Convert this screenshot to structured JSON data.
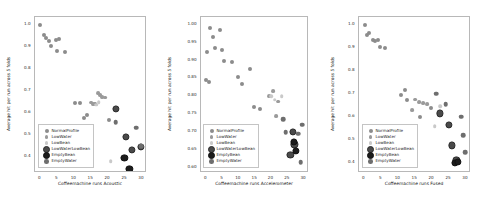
{
  "figure": {
    "width": 486,
    "height": 208,
    "background": "#ffffff",
    "panel_count": 3
  },
  "series_styles": [
    {
      "name": "NormalProfile",
      "color": "#8c8c8c",
      "size": 2.0,
      "edge": "none"
    },
    {
      "name": "LowWater",
      "color": "#9a9a9a",
      "size": 1.9,
      "edge": "none"
    },
    {
      "name": "LowBean",
      "color": "#c9c9c9",
      "size": 1.8,
      "edge": "none"
    },
    {
      "name": "LowWaterLowBean",
      "color": "#4a4a4a",
      "size": 2.6,
      "edge": "#2a2a2a"
    },
    {
      "name": "EmptyBean",
      "color": "#1c1c1c",
      "size": 2.6,
      "edge": "#111111"
    },
    {
      "name": "EmptyWater",
      "color": "#6e6e6e",
      "size": 2.3,
      "edge": "none"
    }
  ],
  "legend": {
    "entries": [
      "NormalProfile",
      "LowWater",
      "LowBean",
      "LowWaterLowBean",
      "EmptyBean",
      "EmptyWater"
    ]
  },
  "chart_data": [
    {
      "type": "scatter",
      "title": "",
      "xlabel": "Coffeemachine runs Acoustic",
      "ylabel": "Average hit per run across 5 folds",
      "xlim": [
        -1.6,
        31.5
      ],
      "ylim": [
        0.325,
        1.035
      ],
      "xticks": [
        0,
        5,
        10,
        15,
        20,
        25,
        30
      ],
      "xticklabels": [
        "0",
        "5",
        "10",
        "15",
        "20",
        "25",
        "30"
      ],
      "yticks": [
        0.4,
        0.5,
        0.6,
        0.7,
        0.8,
        0.9,
        1.0
      ],
      "yticklabels": [
        "0.4",
        "0.5",
        "0.6",
        "0.7",
        "0.8",
        "0.9",
        "1.0"
      ],
      "grid": false,
      "legend_position": "lower-left",
      "series": [
        {
          "name": "NormalProfile",
          "points": [
            [
              0,
              1.0
            ],
            [
              1,
              0.955
            ],
            [
              1.6,
              0.94
            ],
            [
              2.6,
              0.925
            ],
            [
              3.2,
              0.905
            ],
            [
              4.5,
              0.93
            ],
            [
              5.6,
              0.935
            ],
            [
              5.0,
              0.878
            ],
            [
              7.3,
              0.877
            ],
            [
              10.2,
              0.645
            ],
            [
              11.7,
              0.645
            ],
            [
              13.0,
              0.575
            ],
            [
              13.8,
              0.59
            ],
            [
              16.2,
              0.64
            ],
            [
              20.2,
              0.565
            ]
          ]
        },
        {
          "name": "LowWater",
          "points": [
            [
              14.9,
              0.645
            ],
            [
              15.6,
              0.638
            ],
            [
              17.0,
              0.69
            ],
            [
              17.6,
              0.678
            ],
            [
              18.3,
              0.672
            ],
            [
              19.0,
              0.668
            ]
          ]
        },
        {
          "name": "LowBean",
          "points": [
            [
              16.4,
              0.635
            ],
            [
              17.2,
              0.648
            ],
            [
              20.8,
              0.378
            ]
          ]
        },
        {
          "name": "LowWaterLowBean",
          "points": [
            [
              22.4,
              0.618
            ],
            [
              25.2,
              0.49
            ],
            [
              27.0,
              0.43
            ],
            [
              29.6,
              0.445
            ]
          ]
        },
        {
          "name": "EmptyBean",
          "points": [
            [
              24.8,
              0.392
            ],
            [
              26.3,
              0.343
            ]
          ]
        },
        {
          "name": "EmptyWater",
          "points": [
            [
              22.2,
              0.555
            ],
            [
              28.3,
              0.532
            ],
            [
              29.7,
              0.447
            ]
          ]
        }
      ]
    },
    {
      "type": "scatter",
      "title": "",
      "xlabel": "Coffeemachine runs Accelerometer",
      "ylabel": "Average hit per run across 5 folds",
      "xlim": [
        -1.6,
        31.5
      ],
      "ylim": [
        0.585,
        1.022
      ],
      "xticks": [
        0,
        5,
        10,
        15,
        20,
        25,
        30
      ],
      "xticklabels": [
        "0",
        "5",
        "10",
        "15",
        "20",
        "25",
        "30"
      ],
      "yticks": [
        0.6,
        0.65,
        0.7,
        0.75,
        0.8,
        0.85,
        0.9,
        0.95,
        1.0
      ],
      "yticklabels": [
        "0.60",
        "0.65",
        "0.70",
        "0.75",
        "0.80",
        "0.85",
        "0.90",
        "0.95",
        "1.00"
      ],
      "grid": false,
      "legend_position": "lower-left",
      "series": [
        {
          "name": "NormalProfile",
          "points": [
            [
              0.3,
              0.925
            ],
            [
              1.1,
              0.99
            ],
            [
              2.0,
              0.965
            ],
            [
              2.6,
              0.935
            ],
            [
              4.3,
              0.985
            ],
            [
              4.9,
              0.93
            ],
            [
              5.4,
              0.9
            ],
            [
              7.8,
              0.895
            ],
            [
              9.6,
              0.855
            ],
            [
              11.0,
              0.835
            ],
            [
              13.4,
              0.875
            ],
            [
              14.6,
              0.77
            ],
            [
              16.6,
              0.765
            ],
            [
              0.0,
              0.845
            ],
            [
              0.9,
              0.84
            ]
          ]
        },
        {
          "name": "LowWater",
          "points": [
            [
              19.2,
              0.8
            ],
            [
              20.6,
              0.815
            ],
            [
              22.0,
              0.785
            ],
            [
              21.3,
              0.745
            ]
          ]
        },
        {
          "name": "LowBean",
          "points": [
            [
              20.0,
              0.8
            ],
            [
              21.0,
              0.79
            ],
            [
              23.1,
              0.8
            ]
          ]
        },
        {
          "name": "LowWaterLowBean",
          "points": [
            [
              26.5,
              0.7
            ],
            [
              27.0,
              0.665
            ],
            [
              25.8,
              0.635
            ]
          ]
        },
        {
          "name": "EmptyBean",
          "points": [
            [
              26.9,
              0.672
            ],
            [
              27.4,
              0.648
            ]
          ]
        },
        {
          "name": "EmptyWater",
          "points": [
            [
              23.6,
              0.735
            ],
            [
              24.3,
              0.7
            ],
            [
              28.2,
              0.695
            ],
            [
              29.4,
              0.72
            ],
            [
              29.0,
              0.615
            ]
          ]
        }
      ]
    },
    {
      "type": "scatter",
      "title": "",
      "xlabel": "Coffeemachine runs Fused",
      "ylabel": "Average hit per run across 5 folds",
      "xlim": [
        -1.6,
        31.5
      ],
      "ylim": [
        0.355,
        1.035
      ],
      "xticks": [
        0,
        5,
        10,
        15,
        20,
        25,
        30
      ],
      "xticklabels": [
        "0",
        "5",
        "10",
        "15",
        "20",
        "25",
        "30"
      ],
      "yticks": [
        0.4,
        0.5,
        0.6,
        0.7,
        0.8,
        0.9,
        1.0
      ],
      "yticklabels": [
        "0.4",
        "0.5",
        "0.6",
        "0.7",
        "0.8",
        "0.9",
        "1.0"
      ],
      "grid": false,
      "legend_position": "lower-left",
      "series": [
        {
          "name": "NormalProfile",
          "points": [
            [
              0.2,
              1.0
            ],
            [
              0.8,
              0.955
            ],
            [
              1.5,
              0.965
            ],
            [
              2.4,
              0.935
            ],
            [
              3.2,
              0.93
            ],
            [
              4.0,
              0.935
            ],
            [
              4.6,
              0.905
            ],
            [
              6.0,
              0.9
            ],
            [
              10.8,
              0.695
            ],
            [
              12.0,
              0.715
            ],
            [
              12.5,
              0.675
            ],
            [
              16.3,
              0.6
            ],
            [
              19.6,
              0.64
            ]
          ]
        },
        {
          "name": "LowWater",
          "points": [
            [
              15.0,
              0.675
            ],
            [
              16.2,
              0.665
            ],
            [
              17.4,
              0.66
            ],
            [
              18.6,
              0.655
            ],
            [
              14.2,
              0.63
            ]
          ]
        },
        {
          "name": "LowBean",
          "points": [
            [
              20.8,
              0.56
            ],
            [
              22.4,
              0.645
            ]
          ]
        },
        {
          "name": "LowWaterLowBean",
          "points": [
            [
              22.3,
              0.615
            ],
            [
              25.0,
              0.565
            ],
            [
              25.9,
              0.475
            ],
            [
              27.2,
              0.41
            ]
          ]
        },
        {
          "name": "EmptyBean",
          "points": [
            [
              26.7,
              0.4
            ],
            [
              27.6,
              0.405
            ]
          ]
        },
        {
          "name": "EmptyWater",
          "points": [
            [
              21.2,
              0.7
            ],
            [
              24.0,
              0.655
            ],
            [
              28.6,
              0.6
            ],
            [
              29.2,
              0.52
            ],
            [
              29.8,
              0.445
            ]
          ]
        }
      ]
    }
  ]
}
